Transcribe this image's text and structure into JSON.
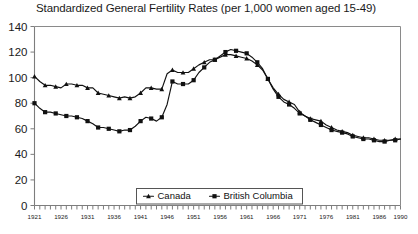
{
  "chart_data": {
    "type": "line",
    "title": "Standardized General Fertility Rates (per 1,000 women aged 15-49)",
    "xlabel": "",
    "ylabel": "",
    "xlim": [
      1921,
      1990
    ],
    "ylim": [
      0,
      140
    ],
    "yticks": [
      0,
      20,
      40,
      60,
      80,
      100,
      120,
      140
    ],
    "xticks_labeled": [
      1921,
      1926,
      1931,
      1936,
      1941,
      1946,
      1951,
      1956,
      1961,
      1966,
      1971,
      1976,
      1981,
      1986,
      1990
    ],
    "xtick_labels": [
      "1921",
      "1926",
      "1931",
      "1936",
      "1941",
      "1946",
      "1951",
      "1956",
      "1961",
      "1966",
      "1971",
      "1976",
      "1981",
      "1986",
      "1990"
    ],
    "grid": false,
    "legend_position": "bottom-center",
    "x": [
      1921,
      1922,
      1923,
      1924,
      1925,
      1926,
      1927,
      1928,
      1929,
      1930,
      1931,
      1932,
      1933,
      1934,
      1935,
      1936,
      1937,
      1938,
      1939,
      1940,
      1941,
      1942,
      1943,
      1944,
      1945,
      1946,
      1947,
      1948,
      1949,
      1950,
      1951,
      1952,
      1953,
      1954,
      1955,
      1956,
      1957,
      1958,
      1959,
      1960,
      1961,
      1962,
      1963,
      1964,
      1965,
      1966,
      1967,
      1968,
      1969,
      1970,
      1971,
      1972,
      1973,
      1974,
      1975,
      1976,
      1977,
      1978,
      1979,
      1980,
      1981,
      1982,
      1983,
      1984,
      1985,
      1986,
      1987,
      1988,
      1989,
      1990
    ],
    "series": [
      {
        "name": "Canada",
        "marker": "triangle",
        "color": "#111111",
        "values": [
          101,
          97,
          94,
          94,
          93,
          92,
          95,
          95,
          94,
          94,
          92,
          92,
          88,
          87,
          86,
          85,
          84,
          85,
          84,
          85,
          88,
          92,
          92,
          91,
          91,
          103,
          106,
          104,
          104,
          104,
          107,
          110,
          112,
          114,
          114,
          116,
          118,
          118,
          117,
          116,
          115,
          113,
          110,
          106,
          99,
          92,
          87,
          83,
          81,
          79,
          73,
          70,
          68,
          67,
          66,
          63,
          61,
          59,
          58,
          57,
          55,
          54,
          53,
          53,
          52,
          51,
          51,
          51,
          52,
          52
        ]
      },
      {
        "name": "British Columbia",
        "marker": "square",
        "color": "#111111",
        "values": [
          80,
          76,
          73,
          73,
          72,
          71,
          70,
          70,
          69,
          68,
          66,
          64,
          61,
          61,
          60,
          59,
          58,
          59,
          59,
          62,
          66,
          69,
          68,
          66,
          69,
          79,
          97,
          95,
          95,
          95,
          98,
          104,
          108,
          112,
          114,
          117,
          120,
          122,
          121,
          120,
          119,
          116,
          112,
          107,
          99,
          91,
          85,
          81,
          79,
          76,
          72,
          70,
          67,
          65,
          63,
          61,
          59,
          58,
          57,
          56,
          54,
          53,
          52,
          52,
          51,
          50,
          50,
          51,
          51,
          52
        ]
      }
    ]
  },
  "legend": {
    "entries": [
      {
        "label": "Canada",
        "marker": "triangle"
      },
      {
        "label": "British Columbia",
        "marker": "square"
      }
    ]
  }
}
